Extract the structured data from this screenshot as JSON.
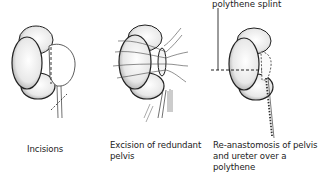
{
  "figure": {
    "panels": [
      {
        "id": "incisions",
        "caption": "Incisions"
      },
      {
        "id": "excision",
        "caption_line1": "Excision of redundant",
        "caption_line2": "pelvis"
      },
      {
        "id": "reanastomosis",
        "caption_line1": "Re-anastomosis of pelvis",
        "caption_line2": "and ureter over a polythene",
        "caption_line3": "nephrostomy tube",
        "callout": "polythene splint"
      }
    ]
  }
}
